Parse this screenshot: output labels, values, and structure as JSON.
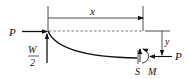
{
  "diagram": {
    "type": "beam-free-body",
    "labels": {
      "x": "x",
      "p_left": "P",
      "w_num": "W",
      "w_den": "2",
      "y": "y",
      "s": "S",
      "m": "M",
      "p_right": "P"
    },
    "colors": {
      "stroke": "#111111",
      "dashed": "#555555",
      "background": "#ffffff"
    }
  }
}
